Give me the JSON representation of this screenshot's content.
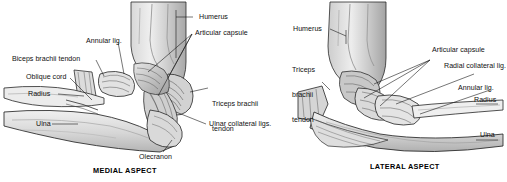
{
  "figure": {
    "background_color": "#ffffff",
    "ink_color": "#1a1a1a"
  },
  "panels": [
    {
      "id": "medial",
      "caption": "MEDIAL ASPECT",
      "labels": [
        {
          "name": "humerus",
          "text": "Humerus"
        },
        {
          "name": "articular-capsule",
          "text": "Articular capsule"
        },
        {
          "name": "annular-lig",
          "text": "Annular lig."
        },
        {
          "name": "biceps-brachii-tendon",
          "text": "Biceps brachii tendon"
        },
        {
          "name": "oblique-cord",
          "text": "Oblique cord"
        },
        {
          "name": "radius",
          "text": "Radius"
        },
        {
          "name": "ulna",
          "text": "Ulna"
        },
        {
          "name": "triceps-brachii-tendon",
          "text": "Triceps brachii",
          "text2": "tendon"
        },
        {
          "name": "ulnar-collateral-ligs",
          "text": "Ulnar collateral ligs."
        },
        {
          "name": "olecranon",
          "text": "Olecranon"
        }
      ]
    },
    {
      "id": "lateral",
      "caption": "LATERAL ASPECT",
      "labels": [
        {
          "name": "humerus",
          "text": "Humerus"
        },
        {
          "name": "triceps-brachii-tendon",
          "text": "Triceps",
          "text2": "brachii",
          "text3": "tendon"
        },
        {
          "name": "articular-capsule",
          "text": "Articular capsule"
        },
        {
          "name": "radial-collateral-lig",
          "text": "Radial collateral lig."
        },
        {
          "name": "annular-lig",
          "text": "Annular lig."
        },
        {
          "name": "radius",
          "text": "Radius"
        },
        {
          "name": "ulna",
          "text": "Ulna"
        }
      ]
    }
  ]
}
